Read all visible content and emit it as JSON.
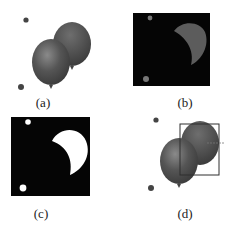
{
  "figure": {
    "panels": [
      {
        "id": "a",
        "label": "(a)",
        "description": "original image of two balloons"
      },
      {
        "id": "b",
        "label": "(b)",
        "description": "masked region of back balloon on black"
      },
      {
        "id": "c",
        "label": "(c)",
        "description": "binary mask of back balloon"
      },
      {
        "id": "d",
        "label": "(d)",
        "description": "bounding box around back balloon"
      }
    ],
    "colors": {
      "balloon": "#4a4a4a",
      "balloon_highlight": "#7a7a7a",
      "mask_background": "#050505",
      "mask_foreground": "#ffffff",
      "masked_balloon": "#5c5c5c",
      "bbox": "#333333"
    }
  }
}
